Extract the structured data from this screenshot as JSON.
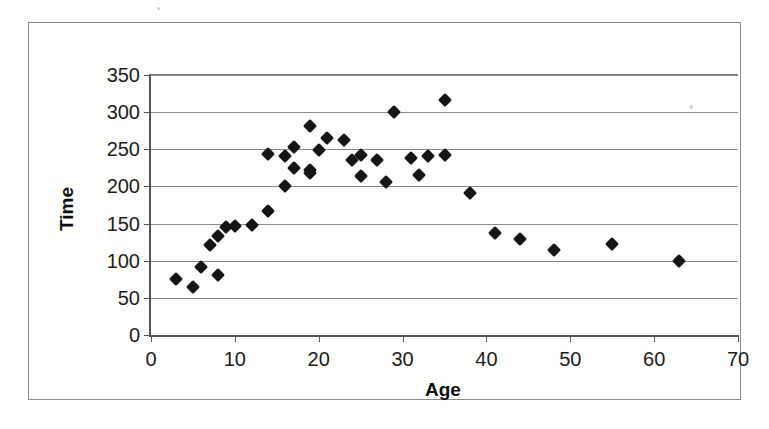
{
  "chart_data": {
    "type": "scatter",
    "title": "",
    "xlabel": "Age",
    "ylabel": "Time",
    "xlim": [
      0,
      70
    ],
    "ylim": [
      0,
      350
    ],
    "xticks": [
      0,
      10,
      20,
      30,
      40,
      50,
      60,
      70
    ],
    "yticks": [
      0,
      50,
      100,
      150,
      200,
      250,
      300,
      350
    ],
    "grid": "horizontal",
    "legend": "none",
    "marker": "filled-diamond",
    "marker_color": "#151515",
    "series": [
      {
        "name": "Time vs Age",
        "points": [
          {
            "x": 3,
            "y": 76
          },
          {
            "x": 5,
            "y": 64
          },
          {
            "x": 6,
            "y": 91
          },
          {
            "x": 8,
            "y": 81
          },
          {
            "x": 7,
            "y": 121
          },
          {
            "x": 8,
            "y": 133
          },
          {
            "x": 9,
            "y": 145
          },
          {
            "x": 10,
            "y": 147
          },
          {
            "x": 12,
            "y": 148
          },
          {
            "x": 14,
            "y": 167
          },
          {
            "x": 16,
            "y": 200
          },
          {
            "x": 14,
            "y": 243
          },
          {
            "x": 16,
            "y": 241
          },
          {
            "x": 17,
            "y": 253
          },
          {
            "x": 17,
            "y": 225
          },
          {
            "x": 19,
            "y": 281
          },
          {
            "x": 19,
            "y": 222
          },
          {
            "x": 19,
            "y": 218
          },
          {
            "x": 20,
            "y": 249
          },
          {
            "x": 21,
            "y": 265
          },
          {
            "x": 23,
            "y": 262
          },
          {
            "x": 24,
            "y": 236
          },
          {
            "x": 25,
            "y": 242
          },
          {
            "x": 25,
            "y": 214
          },
          {
            "x": 27,
            "y": 235
          },
          {
            "x": 28,
            "y": 206
          },
          {
            "x": 29,
            "y": 300
          },
          {
            "x": 31,
            "y": 238
          },
          {
            "x": 32,
            "y": 216
          },
          {
            "x": 33,
            "y": 241
          },
          {
            "x": 35,
            "y": 316
          },
          {
            "x": 35,
            "y": 242
          },
          {
            "x": 38,
            "y": 191
          },
          {
            "x": 41,
            "y": 137
          },
          {
            "x": 44,
            "y": 129
          },
          {
            "x": 48,
            "y": 114
          },
          {
            "x": 55,
            "y": 123
          },
          {
            "x": 63,
            "y": 100
          }
        ]
      }
    ]
  },
  "axes": {
    "x_title": "Age",
    "y_title": "Time",
    "x_tick_labels": [
      "0",
      "10",
      "20",
      "30",
      "40",
      "50",
      "60",
      "70"
    ],
    "y_tick_labels": [
      "0",
      "50",
      "100",
      "150",
      "200",
      "250",
      "300",
      "350"
    ]
  },
  "style": {
    "background": "#ffffff",
    "frame_color": "#8b8b8b",
    "axis_color": "#555555",
    "gridline_color": "#8a8a8a",
    "marker_color": "#151515",
    "text_color": "#1c1c1c"
  }
}
